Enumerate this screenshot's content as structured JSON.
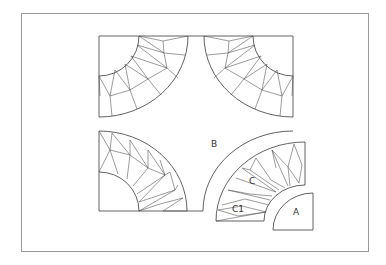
{
  "diagram": {
    "title": "",
    "type": "quilt-block-pattern",
    "colors": {
      "line": "#3a3a3a",
      "frame": "#9a9a9a",
      "background": "#ffffff"
    },
    "labels": {
      "a": "A",
      "b": "B",
      "c": "C",
      "c1": "C1"
    },
    "pieces": [
      {
        "id": "A",
        "description": "quarter-circle center piece"
      },
      {
        "id": "B",
        "description": "background piece with concave arcs"
      },
      {
        "id": "C",
        "description": "pieced arc of triangles"
      },
      {
        "id": "C1",
        "description": "end diamond piece of arc"
      }
    ]
  }
}
